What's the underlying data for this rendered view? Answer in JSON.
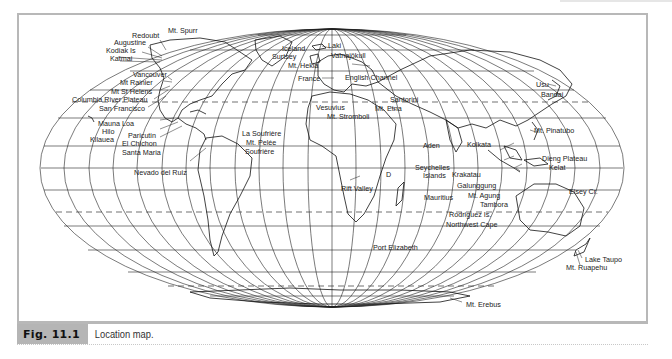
{
  "figure": {
    "number": "Fig. 11.1",
    "caption": "Location map."
  },
  "map": {
    "projection": "Mollweide-style world map",
    "labels": {
      "mt_spurr": "Mt. Spurr",
      "redoubt": "Redoubt",
      "augustine": "Augustine",
      "kodiak": "Kodiak Is",
      "katmai": "Katmai",
      "vancouver": "Vancouver",
      "mt_rainier": "Mt Rainier",
      "mt_st_helens": "Mt St Helens",
      "columbia": "Columbia River Plateau",
      "san_francisco": "San Francisco",
      "mauna_loa": "Mauna Loa",
      "hilo": "Hilo",
      "kilauea": "Kilauea",
      "paricutin": "Paricutin",
      "el_chichon": "El Chichon",
      "santa_maria": "Santa Maria",
      "nevado_del_ruiz": "Nevado del Ruiz",
      "la_soufriere": "La Soufrière",
      "mt_pelee": "Mt. Pelée",
      "soufriere": "Soufrière",
      "iceland": "Iceland",
      "surtsey": "Surtsey",
      "laki": "Laki",
      "vatnajokull": "Vatnajökull",
      "mt_hekla": "Mt. Hekla",
      "france": "France",
      "english_channel": "English Channel",
      "santorini": "Santorini",
      "vesuvius": "Vesuvius",
      "mt_etna": "Mt. Etna",
      "mt_stromboli": "Mt. Stromboli",
      "rift_valley": "Rift Valley",
      "aden": "Aden",
      "seychelles": "Seychelles",
      "islands": "Islands",
      "mauritius": "Mauritius",
      "rodriguez": "Rodriguez Is.",
      "northwest_cape": "Northwest Cape",
      "port_elizabeth": "Port Elizabeth",
      "kolkata": "Kolkata",
      "krakatau": "Krakatau",
      "galunggung": "Galunggung",
      "mt_agung": "Mt. Agung",
      "tambora": "Tambora",
      "dieng_plateau": "Dieng Plateau",
      "kelat": "Kelat",
      "elsey_cr": "Elsey Cr.",
      "mt_pinatubo": "Mt. Pinatubo",
      "usu": "Usu",
      "bandai": "Bandai",
      "lake_taupo": "Lake Taupo",
      "mt_ruapehu": "Mt. Ruapehu",
      "mt_erebus": "Mt. Erebus",
      "d_marker": "D"
    }
  }
}
